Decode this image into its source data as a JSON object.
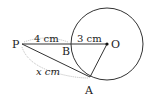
{
  "diagram": {
    "points": {
      "P": {
        "label": "P",
        "x": 22,
        "y": 44
      },
      "B": {
        "label": "B",
        "x": 71,
        "y": 44
      },
      "O": {
        "label": "O",
        "x": 107,
        "y": 44
      },
      "A": {
        "label": "A",
        "x": 90,
        "y": 77
      }
    },
    "circle": {
      "center": "O",
      "radius": 36
    },
    "lengths": {
      "PB": "4 cm",
      "BO": "3 cm",
      "PA": "x cm"
    },
    "colors": {
      "stroke": "#333333",
      "dim": "#aaaaaa"
    }
  }
}
